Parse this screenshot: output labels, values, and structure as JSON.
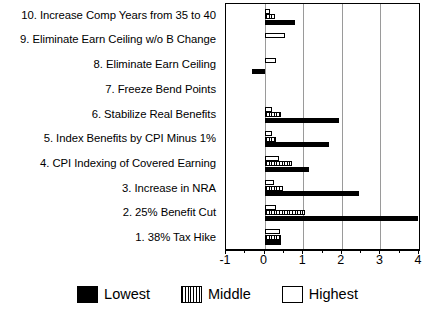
{
  "chart_data": {
    "type": "bar",
    "orientation": "horizontal",
    "title": "",
    "xlabel": "",
    "ylabel": "",
    "xlim": [
      -1,
      4
    ],
    "xticks": [
      -1,
      0,
      1,
      2,
      3,
      4
    ],
    "xtick_labels": [
      "-1",
      "0",
      "1",
      "2",
      "3",
      "4"
    ],
    "grid": true,
    "grid_axis": "x",
    "legend_position": "bottom-center",
    "categories": [
      "10. Increase Comp Years from 35 to 40",
      "9.  Eliminate Earn Ceiling w/o B Change",
      "8.  Eliminate Earn Ceiling",
      "7.  Freeze Bend Points",
      "6.  Stabilize Real Benefits",
      "5.  Index Benefits by CPI Minus 1%",
      "4.  CPI Indexing of Covered Earning",
      "3.  Increase in NRA",
      "2.  25% Benefit Cut",
      "1.  38% Tax Hike"
    ],
    "series": [
      {
        "name": "Lowest",
        "color": "#000000",
        "pattern": "solid",
        "values": [
          0.78,
          0.0,
          -0.32,
          0.0,
          1.92,
          1.68,
          1.15,
          2.45,
          3.98,
          0.42
        ]
      },
      {
        "name": "Middle",
        "color": "#000000",
        "pattern": "vertical-stripes",
        "values": [
          0.28,
          0.0,
          0.0,
          0.0,
          0.42,
          0.3,
          0.7,
          0.48,
          1.05,
          0.43
        ]
      },
      {
        "name": "Highest",
        "color": "#ffffff",
        "pattern": "open",
        "values": [
          0.15,
          0.52,
          0.3,
          0.0,
          0.2,
          0.2,
          0.38,
          0.25,
          0.3,
          0.4
        ]
      }
    ]
  },
  "legend": {
    "entries": [
      {
        "label": "Lowest",
        "swatch": "lowest"
      },
      {
        "label": "Middle",
        "swatch": "middle"
      },
      {
        "label": "Highest",
        "swatch": "highest"
      }
    ]
  }
}
